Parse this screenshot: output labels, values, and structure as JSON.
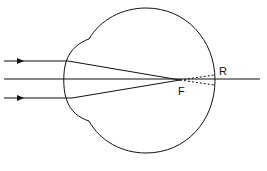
{
  "diagram": {
    "labels": {
      "focus": "F",
      "retina": "R"
    },
    "colors": {
      "stroke": "#111111",
      "background": "#ffffff"
    }
  }
}
